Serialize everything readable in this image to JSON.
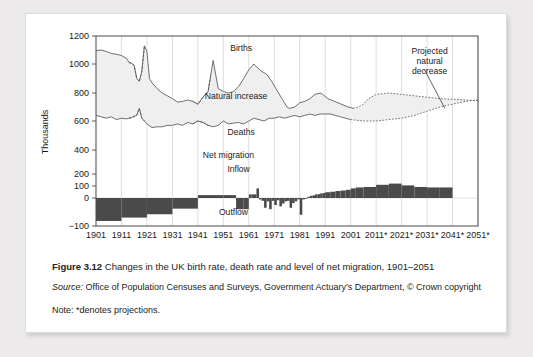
{
  "figure": {
    "caption_label": "Figure 3.12",
    "caption_text": "Changes in the UK birth rate, death rate and level of net migration, 1901–2051",
    "source_label": "Source:",
    "source_text": "Office of Population Censuses and Surveys, Government Actuary’s Department, © Crown copyright",
    "note_text": "Note: *denotes projections."
  },
  "chart_data": {
    "type": "line",
    "title": "Changes in the UK birth rate, death rate and level of net migration, 1901–2051",
    "xlabel": "",
    "ylabel": "Thousands",
    "ylim": [
      -100,
      1200
    ],
    "xlim": [
      1901,
      2051
    ],
    "grid": true,
    "legend": "none",
    "ytick_labels": [
      "1200",
      "1000",
      "800",
      "600",
      "400",
      "200",
      "100",
      "0",
      "−100"
    ],
    "ytick_values": [
      1200,
      1000,
      800,
      600,
      400,
      200,
      100,
      0,
      -100
    ],
    "xtick_labels": [
      "1901",
      "1911",
      "1921",
      "1931",
      "1941",
      "1951",
      "1961",
      "1971",
      "1981",
      "1991",
      "2001",
      "2011*",
      "2021*",
      "2031*",
      "2041*",
      "2051*"
    ],
    "xtick_values": [
      1901,
      1911,
      1921,
      1931,
      1941,
      1951,
      1961,
      1971,
      1981,
      1991,
      2001,
      2011,
      2021,
      2031,
      2041,
      2051
    ],
    "annotations": [
      {
        "name": "births",
        "text": "Births",
        "x": 1958,
        "y": 1090
      },
      {
        "name": "natural-increase",
        "text": "Natural increase",
        "x": 1956,
        "y": 760
      },
      {
        "name": "deaths",
        "text": "Deaths",
        "x": 1958,
        "y": 505
      },
      {
        "name": "net-migration",
        "text": "Net migration",
        "x": 1953,
        "y": 330
      },
      {
        "name": "inflow",
        "text": "Inflow",
        "x": 1957,
        "y": 215
      },
      {
        "name": "outflow",
        "text": "Outflow",
        "x": 1955,
        "y": -60
      },
      {
        "name": "projected-natural-decrease",
        "text": "Projected\nnatural\ndecrease",
        "x": 2032,
        "y": 1075
      }
    ],
    "series": [
      {
        "name": "Births",
        "style": "solid-then-dotted",
        "x": [
          1901,
          1903,
          1905,
          1907,
          1909,
          1911,
          1913,
          1914,
          1915,
          1916,
          1917,
          1918,
          1919,
          1920,
          1921,
          1922,
          1923,
          1925,
          1927,
          1929,
          1931,
          1933,
          1935,
          1937,
          1939,
          1941,
          1943,
          1945,
          1947,
          1949,
          1951,
          1953,
          1955,
          1957,
          1959,
          1961,
          1963,
          1964,
          1966,
          1968,
          1970,
          1972,
          1974,
          1976,
          1977,
          1979,
          1981,
          1983,
          1985,
          1987,
          1989,
          1990,
          1992,
          1994,
          1996,
          1998,
          2000,
          2002,
          2004,
          2006,
          2008,
          2011,
          2016,
          2021,
          2026,
          2031,
          2036,
          2041,
          2046,
          2051
        ],
        "y": [
          1095,
          1100,
          1090,
          1075,
          1070,
          1060,
          1040,
          1010,
          1005,
          990,
          900,
          880,
          950,
          1130,
          1090,
          900,
          870,
          830,
          800,
          780,
          760,
          735,
          740,
          750,
          740,
          720,
          770,
          810,
          1025,
          830,
          810,
          800,
          810,
          845,
          900,
          960,
          1000,
          980,
          950,
          930,
          880,
          820,
          760,
          700,
          690,
          700,
          730,
          740,
          760,
          790,
          800,
          790,
          760,
          745,
          730,
          715,
          700,
          690,
          700,
          720,
          760,
          790,
          800,
          790,
          780,
          770,
          760,
          755,
          750,
          745
        ]
      },
      {
        "name": "Deaths",
        "style": "solid-then-dotted",
        "x": [
          1901,
          1903,
          1905,
          1907,
          1909,
          1911,
          1913,
          1915,
          1917,
          1918,
          1919,
          1920,
          1921,
          1923,
          1925,
          1927,
          1929,
          1931,
          1933,
          1935,
          1937,
          1939,
          1941,
          1943,
          1945,
          1947,
          1949,
          1951,
          1953,
          1955,
          1957,
          1959,
          1961,
          1963,
          1965,
          1967,
          1969,
          1971,
          1973,
          1975,
          1977,
          1979,
          1981,
          1983,
          1985,
          1987,
          1989,
          1991,
          1993,
          1995,
          1997,
          1999,
          2001,
          2006,
          2011,
          2016,
          2021,
          2026,
          2031,
          2036,
          2041,
          2046,
          2051
        ],
        "y": [
          640,
          630,
          620,
          630,
          610,
          620,
          615,
          625,
          640,
          690,
          620,
          600,
          580,
          555,
          560,
          560,
          570,
          570,
          580,
          570,
          590,
          580,
          600,
          590,
          570,
          560,
          570,
          600,
          580,
          585,
          590,
          580,
          600,
          620,
          610,
          600,
          620,
          620,
          630,
          620,
          630,
          640,
          630,
          640,
          650,
          640,
          650,
          650,
          650,
          640,
          630,
          620,
          610,
          600,
          600,
          610,
          620,
          640,
          670,
          700,
          720,
          740,
          750
        ]
      },
      {
        "name": "Net migration",
        "style": "bars",
        "x": [
          1901,
          1911,
          1921,
          1931,
          1941,
          1951,
          1956,
          1959,
          1961,
          1962,
          1964,
          1965,
          1966,
          1967,
          1968,
          1969,
          1970,
          1971,
          1972,
          1973,
          1974,
          1975,
          1976,
          1977,
          1978,
          1979,
          1980,
          1981,
          1982,
          1983,
          1984,
          1985,
          1986,
          1987,
          1988,
          1989,
          1990,
          1991,
          1993,
          1995,
          1997,
          1999,
          2001,
          2003,
          2006,
          2011,
          2016,
          2021,
          2026,
          2031,
          2036
        ],
        "y": [
          -82,
          -70,
          -58,
          -38,
          24,
          24,
          -40,
          -40,
          30,
          30,
          80,
          -5,
          -10,
          -35,
          -12,
          -40,
          -10,
          -25,
          -8,
          -30,
          -20,
          -12,
          -10,
          -35,
          -18,
          -12,
          -5,
          -60,
          -5,
          0,
          10,
          18,
          22,
          30,
          32,
          38,
          42,
          48,
          52,
          58,
          62,
          68,
          80,
          88,
          92,
          110,
          120,
          105,
          92,
          88,
          88
        ]
      }
    ],
    "shaded_region": {
      "name": "natural-increase-band",
      "between": [
        "Births",
        "Deaths"
      ],
      "fill": "#eeeeee"
    },
    "colors": {
      "line": "#5f5f5f",
      "bar": "#4a4a4a",
      "shade": "#efefef",
      "grid": "#cfcfcf",
      "axis": "#4a4a4a"
    }
  }
}
